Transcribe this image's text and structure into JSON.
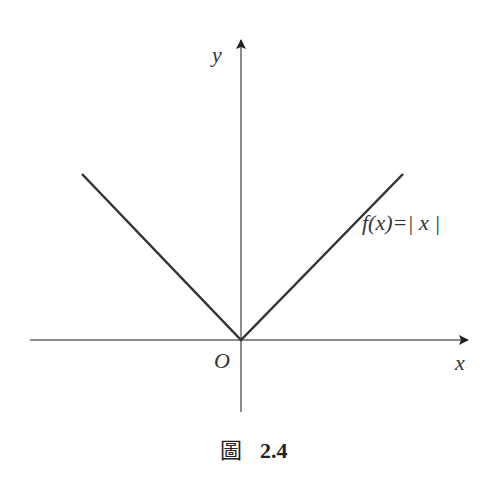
{
  "figure": {
    "y_axis_label": "y",
    "x_axis_label": "x",
    "origin_label": "O",
    "function_label": "f(x)=| x |",
    "caption_prefix": "圖",
    "caption_number": "2.4"
  },
  "colors": {
    "axis": "#555555",
    "curve": "#333333",
    "text": "#333333"
  }
}
